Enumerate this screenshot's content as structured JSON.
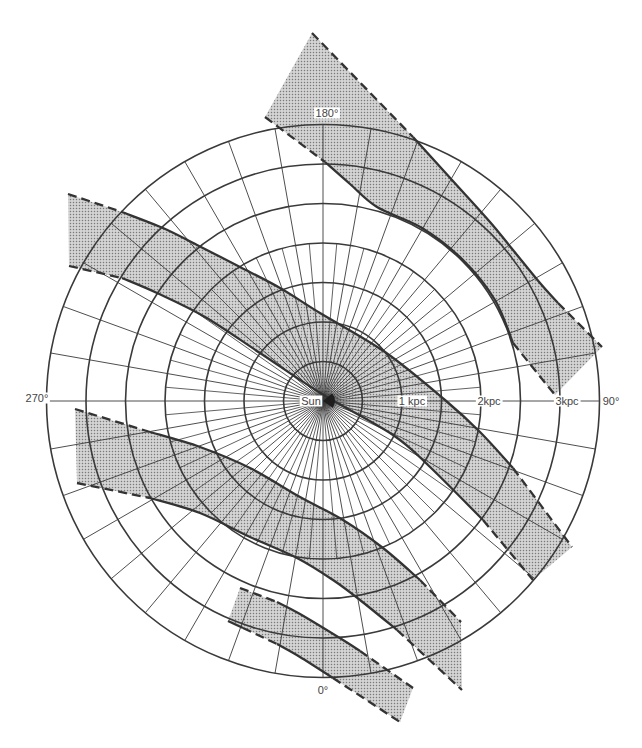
{
  "diagram": {
    "center": {
      "x": 323,
      "y": 401
    },
    "scale_px_per_kpc": 79,
    "rings_kpc": [
      0.5,
      1,
      1.5,
      2,
      2.5,
      3,
      3.5
    ],
    "spokes": {
      "major_step_deg": 10,
      "minor_step_deg": 5,
      "minor_max_kpc": 2
    },
    "colors": {
      "background": "#ffffff",
      "line": "#3a3a3a",
      "band_fill": "#d8d8d8",
      "stipple_dot": "#7a7a7a",
      "label": "#444444"
    },
    "labels": [
      {
        "id": "sun",
        "text": "Sun",
        "x": 311,
        "y": 405
      },
      {
        "id": "dist-1kpc",
        "text": "1 kpc",
        "x": 412,
        "y": 405
      },
      {
        "id": "dist-2kpc",
        "text": "2kpc",
        "x": 489,
        "y": 405
      },
      {
        "id": "dist-3kpc",
        "text": "3kpc",
        "x": 567,
        "y": 405
      },
      {
        "id": "lon-90",
        "text": "90°",
        "x": 611,
        "y": 405
      },
      {
        "id": "lon-180",
        "text": "180°",
        "x": 327,
        "y": 117
      },
      {
        "id": "lon-270",
        "text": "270°",
        "x": 37,
        "y": 402
      },
      {
        "id": "lon-0",
        "text": "0°",
        "x": 323,
        "y": 694
      }
    ],
    "bands": [
      {
        "name": "band-1-upper-right",
        "upper": [
          {
            "style": "dashed",
            "points": [
              [
                312,
                33
              ],
              [
                413,
                137
              ]
            ]
          },
          {
            "style": "solid",
            "points": [
              [
                413,
                137
              ],
              [
                452,
                180
              ],
              [
                490,
                222
              ],
              [
                513,
                250
              ],
              [
                540,
                283
              ],
              [
                558,
                303
              ]
            ]
          },
          {
            "style": "dashed",
            "points": [
              [
                558,
                303
              ],
              [
                602,
                347
              ]
            ]
          }
        ],
        "lower": [
          {
            "style": "dashed",
            "points": [
              [
                265,
                117
              ],
              [
                325,
                162
              ]
            ]
          },
          {
            "style": "solid",
            "points": [
              [
                325,
                162
              ],
              [
                350,
                184
              ],
              [
                377,
                207
              ],
              [
                422,
                228
              ],
              [
                463,
                260
              ],
              [
                495,
                300
              ],
              [
                513,
                343
              ]
            ]
          },
          {
            "style": "dashed",
            "points": [
              [
                513,
                343
              ],
              [
                555,
                395
              ]
            ]
          }
        ]
      },
      {
        "name": "band-2-through-sun",
        "upper": [
          {
            "style": "dashed",
            "points": [
              [
                68,
                194
              ],
              [
                122,
                212
              ]
            ]
          },
          {
            "style": "solid",
            "points": [
              [
                122,
                212
              ],
              [
                163,
                228
              ],
              [
                197,
                245
              ],
              [
                240,
                267
              ],
              [
                280,
                288
              ],
              [
                320,
                313
              ],
              [
                385,
                352
              ],
              [
                445,
                400
              ],
              [
                480,
                432
              ],
              [
                513,
                468
              ]
            ]
          },
          {
            "style": "dashed",
            "points": [
              [
                513,
                468
              ],
              [
                572,
                547
              ]
            ]
          }
        ],
        "lower": [
          {
            "style": "dashed",
            "points": [
              [
                69,
                266
              ],
              [
                122,
                278
              ]
            ]
          },
          {
            "style": "solid",
            "points": [
              [
                122,
                278
              ],
              [
                157,
                293
              ],
              [
                205,
                317
              ],
              [
                260,
                353
              ],
              [
                322,
                394
              ],
              [
                393,
                435
              ],
              [
                430,
                467
              ],
              [
                483,
                520
              ]
            ]
          },
          {
            "style": "dashed",
            "points": [
              [
                483,
                520
              ],
              [
                533,
                580
              ]
            ]
          }
        ]
      },
      {
        "name": "band-3-lower-left",
        "upper": [
          {
            "style": "dashed",
            "points": [
              [
                75,
                409
              ],
              [
                150,
                432
              ]
            ]
          },
          {
            "style": "solid",
            "points": [
              [
                150,
                432
              ],
              [
                200,
                447
              ],
              [
                250,
                468
              ],
              [
                300,
                497
              ],
              [
                343,
                520
              ],
              [
                383,
                548
              ],
              [
                420,
                580
              ]
            ]
          },
          {
            "style": "dashed",
            "points": [
              [
                420,
                580
              ],
              [
                461,
                622
              ]
            ]
          }
        ],
        "lower": [
          {
            "style": "dashed",
            "points": [
              [
                77,
                483
              ],
              [
                150,
                498
              ]
            ]
          },
          {
            "style": "solid",
            "points": [
              [
                150,
                498
              ],
              [
                200,
                513
              ],
              [
                250,
                537
              ],
              [
                297,
                558
              ],
              [
                333,
                580
              ],
              [
                360,
                600
              ],
              [
                397,
                630
              ]
            ]
          },
          {
            "style": "dashed",
            "points": [
              [
                397,
                630
              ],
              [
                462,
                690
              ]
            ]
          }
        ]
      },
      {
        "name": "band-4-bottom",
        "upper": [
          {
            "style": "dashed",
            "points": [
              [
                240,
                588
              ],
              [
                277,
                602
              ]
            ]
          },
          {
            "style": "solid",
            "points": [
              [
                277,
                602
              ],
              [
                300,
                614
              ],
              [
                343,
                640
              ],
              [
                360,
                651
              ]
            ]
          },
          {
            "style": "dashed",
            "points": [
              [
                360,
                651
              ],
              [
                413,
                688
              ]
            ]
          }
        ],
        "lower": [
          {
            "style": "solid",
            "points": [
              [
                228,
                621
              ],
              [
                243,
                628
              ]
            ]
          },
          {
            "style": "dashed",
            "points": [
              [
                243,
                628
              ],
              [
                277,
                644
              ]
            ]
          },
          {
            "style": "solid",
            "points": [
              [
                277,
                644
              ],
              [
                300,
                657
              ],
              [
                333,
                678
              ]
            ]
          },
          {
            "style": "dashed",
            "points": [
              [
                333,
                678
              ],
              [
                400,
                722
              ]
            ]
          }
        ]
      }
    ]
  }
}
